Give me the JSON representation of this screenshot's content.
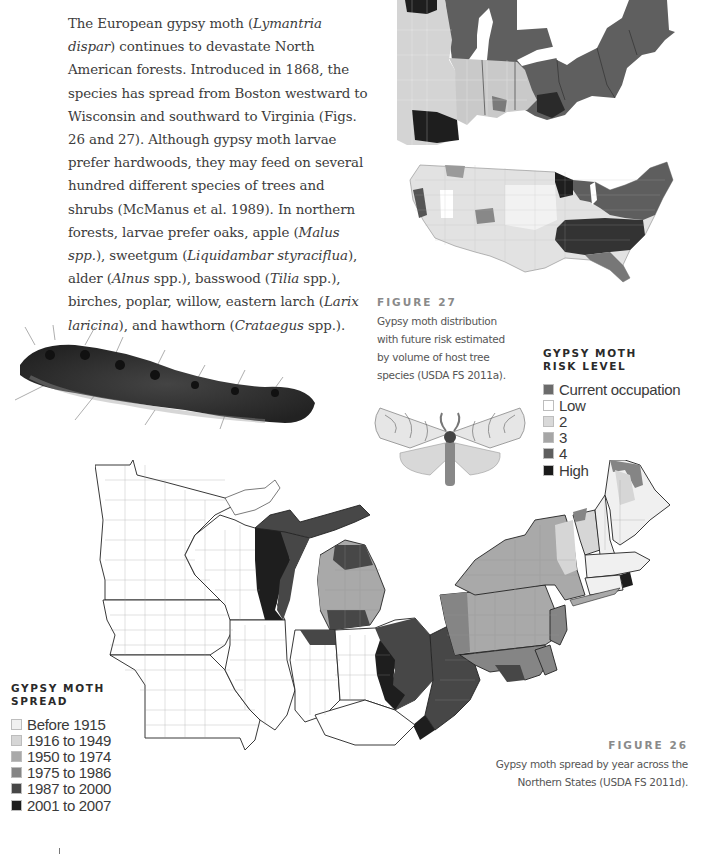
{
  "body_text": {
    "segments": [
      {
        "t": "The European gypsy moth (",
        "i": false
      },
      {
        "t": "Lymantria dispar",
        "i": true
      },
      {
        "t": ") continues to devastate North American forests. Introduced in 1868, the species has spread from Boston westward to Wisconsin and southward to Virginia (Figs. 26 and 27). Although gypsy moth larvae prefer hardwoods, they may feed on several hundred different species of trees and shrubs (McManus et al. 1989). In northern forests, larvae prefer oaks, apple (",
        "i": false
      },
      {
        "t": "Malus spp.",
        "i": true
      },
      {
        "t": "), sweetgum (",
        "i": false
      },
      {
        "t": "Liquidambar styraciflua",
        "i": true
      },
      {
        "t": "), alder (",
        "i": false
      },
      {
        "t": "Alnus",
        "i": true
      },
      {
        "t": " spp.), basswood (",
        "i": false
      },
      {
        "t": "Tilia",
        "i": true
      },
      {
        "t": " spp.), birches, poplar, willow, eastern larch (",
        "i": false
      },
      {
        "t": "Larix laricina",
        "i": true
      },
      {
        "t": "), and hawthorn (",
        "i": false
      },
      {
        "t": "Crataegus",
        "i": true
      },
      {
        "t": " spp.).",
        "i": false
      }
    ]
  },
  "figure_27": {
    "label": "FIGURE 27",
    "caption": "Gypsy moth distribution with future risk estimated by volume of host tree species (USDA FS 2011a).",
    "legend": {
      "title_line1": "GYPSY MOTH",
      "title_line2": "RISK LEVEL",
      "items": [
        {
          "label": "Current occupation",
          "color": "#6b6b6b"
        },
        {
          "label": "Low",
          "color": "#ffffff"
        },
        {
          "label": "2",
          "color": "#d9d9d9"
        },
        {
          "label": "3",
          "color": "#a6a6a6"
        },
        {
          "label": "4",
          "color": "#5e5e5e"
        },
        {
          "label": "High",
          "color": "#1a1a1a"
        }
      ]
    }
  },
  "figure_26": {
    "label": "FIGURE 26",
    "caption": "Gypsy moth spread by year across the Northern States (USDA FS 2011d).",
    "legend": {
      "title_line1": "GYPSY MOTH",
      "title_line2": "SPREAD",
      "items": [
        {
          "label": "Before 1915",
          "color": "#f0f0f0"
        },
        {
          "label": "1916 to 1949",
          "color": "#d6d6d6"
        },
        {
          "label": "1950 to 1974",
          "color": "#a9a9a9"
        },
        {
          "label": "1975 to 1986",
          "color": "#858585"
        },
        {
          "label": "1987 to 2000",
          "color": "#474747"
        },
        {
          "label": "2001 to 2007",
          "color": "#1c1c1c"
        }
      ]
    }
  },
  "images": {
    "caterpillar": "gypsy-moth-caterpillar-photo",
    "moth": "gypsy-moth-adult-photo",
    "map_27_top": "midwest-northeast-risk-map",
    "map_27_us": "us-risk-map",
    "map_26": "northern-states-spread-map"
  }
}
